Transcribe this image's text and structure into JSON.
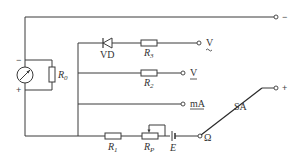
{
  "diagram": {
    "type": "circuit-schematic",
    "components": {
      "meter": {
        "label": "",
        "plus": "+",
        "minus": "−"
      },
      "shunt": {
        "label": "R",
        "sub": "0"
      },
      "diode": {
        "label": "VD"
      },
      "r3": {
        "label": "R",
        "sub": "3"
      },
      "r2": {
        "label": "R",
        "sub": "2"
      },
      "r1": {
        "label": "R",
        "sub": "1"
      },
      "rp": {
        "label": "R",
        "sub": "P"
      },
      "battery": {
        "label": "E"
      },
      "switch": {
        "label": "SA"
      }
    },
    "terminals": {
      "top_minus": "−",
      "ac_voltage": "V",
      "ac_voltage_mark": "~",
      "dc_voltage": "V",
      "dc_voltage_mark": "—",
      "current": "mA",
      "ohm": "Ω",
      "plus": "+"
    },
    "colors": {
      "line": "#3a3a3a",
      "text": "#333333",
      "background": "#ffffff"
    }
  }
}
